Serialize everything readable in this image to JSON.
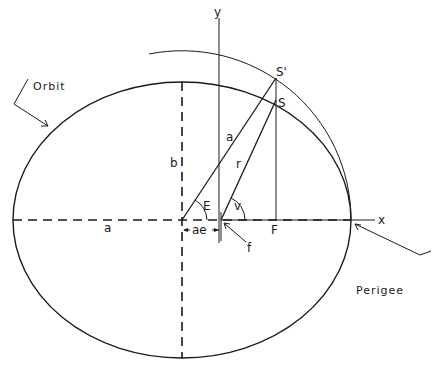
{
  "diagram": {
    "labels": {
      "orbit": "Orbit",
      "perigee": "Perigee",
      "x_axis": "x",
      "y_axis": "y",
      "satellite": "S",
      "satellite_projection": "S'",
      "foot_point": "F",
      "focus": "f",
      "semi_major_radius": "a",
      "semi_major_axis": "a",
      "semi_minor_axis": "b",
      "radius_vector": "r",
      "eccentric_anomaly": "E",
      "true_anomaly": "v",
      "focal_offset": "ae"
    },
    "geometry": {
      "center": [
        182,
        220
      ],
      "semi_major_px": 169,
      "semi_minor_px": 138,
      "focus": [
        221,
        220
      ],
      "S_prime": [
        276,
        78
      ],
      "S": [
        276,
        100
      ],
      "F": [
        276,
        220
      ],
      "perigee": [
        351,
        220
      ]
    },
    "colors": {
      "ink": "#1a1a1a",
      "background": "#ffffff"
    }
  }
}
